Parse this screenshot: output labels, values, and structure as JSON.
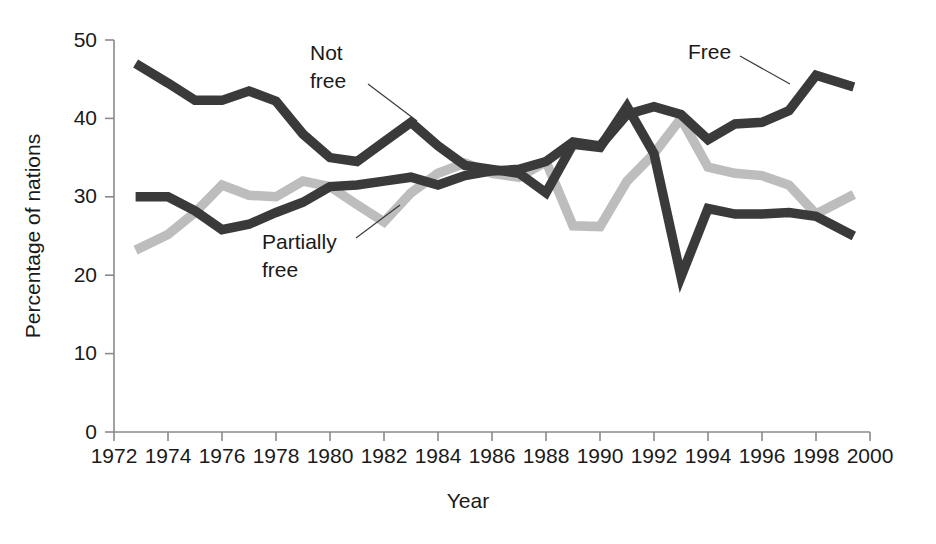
{
  "chart_data": {
    "type": "line",
    "title": "",
    "xlabel": "Year",
    "ylabel": "Percentage of nations",
    "xlim": [
      1972,
      2000
    ],
    "ylim": [
      0,
      50
    ],
    "xticks": [
      1972,
      1974,
      1976,
      1978,
      1980,
      1982,
      1984,
      1986,
      1988,
      1990,
      1992,
      1994,
      1996,
      1998,
      2000
    ],
    "yticks": [
      0,
      10,
      20,
      30,
      40,
      50
    ],
    "grid": false,
    "legend_position": "inline-annotations",
    "x": [
      1972.8,
      1974,
      1975,
      1976,
      1977,
      1978,
      1979,
      1980,
      1981,
      1982,
      1983,
      1984,
      1985,
      1986,
      1987,
      1988,
      1989,
      1990,
      1991,
      1992,
      1993,
      1994,
      1995,
      1996,
      1997,
      1998,
      1999.4
    ],
    "series": [
      {
        "name": "Not free",
        "color": "#3a3a3a",
        "values": [
          47.0,
          44.5,
          42.3,
          42.3,
          43.5,
          42.2,
          38.0,
          35.0,
          34.5,
          37.0,
          39.5,
          36.5,
          34.0,
          33.5,
          33.0,
          30.5,
          36.7,
          36.3,
          41.5,
          35.5,
          19.8,
          28.5,
          27.8,
          27.8,
          28.0,
          27.5,
          25.0
        ]
      },
      {
        "name": "Partially free",
        "color": "#bdbdbd",
        "values": [
          23.2,
          25.2,
          28.0,
          31.5,
          30.2,
          30.0,
          32.0,
          31.3,
          29.0,
          26.8,
          30.5,
          33.0,
          34.3,
          33.0,
          32.5,
          34.5,
          26.3,
          26.2,
          32.0,
          35.5,
          40.0,
          33.8,
          33.0,
          32.7,
          31.5,
          27.8,
          30.3
        ]
      },
      {
        "name": "Free",
        "color": "#3a3a3a",
        "values": [
          30.0,
          30.0,
          28.2,
          25.8,
          26.5,
          28.0,
          29.3,
          31.3,
          31.5,
          32.0,
          32.5,
          31.5,
          32.7,
          33.3,
          33.5,
          34.5,
          37.0,
          36.5,
          40.5,
          41.5,
          40.5,
          37.3,
          39.3,
          39.5,
          41.0,
          45.5,
          44.0
        ]
      }
    ],
    "annotations": [
      {
        "text_line1": "Not",
        "text_line2": "free",
        "target_series": "Not free"
      },
      {
        "text_line1": "Partially",
        "text_line2": "free",
        "target_series": "Partially free"
      },
      {
        "text_line1": "Free",
        "text_line2": "",
        "target_series": "Free"
      }
    ]
  }
}
